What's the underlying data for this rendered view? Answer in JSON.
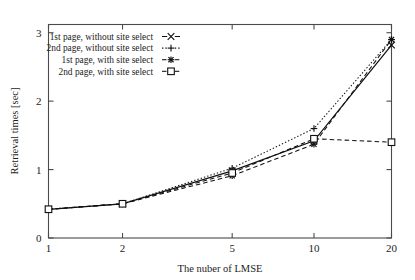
{
  "chart_data": {
    "type": "line",
    "title": "",
    "xlabel": "The nuber of LMSE",
    "ylabel": "Retrieval times [sec]",
    "x": [
      1,
      2,
      5,
      10,
      20
    ],
    "xtick_labels": [
      "1",
      "2",
      "5",
      "10",
      "20"
    ],
    "ytick_labels": [
      "0",
      "1",
      "2",
      "3"
    ],
    "ytick_values": [
      0,
      1,
      2,
      3
    ],
    "ylim": [
      0,
      3.12
    ],
    "xscale": "categorical-log",
    "grid": false,
    "legend_position": "top-left inside plot area",
    "series": [
      {
        "name": "1st page, without site select",
        "marker": "x-cross",
        "linestyle": "solid",
        "values": [
          0.42,
          0.5,
          0.98,
          1.42,
          2.82
        ]
      },
      {
        "name": "2nd page, without site select",
        "marker": "plus",
        "linestyle": "dotted",
        "values": [
          0.42,
          0.5,
          1.02,
          1.6,
          2.9
        ]
      },
      {
        "name": "1st page, with site select",
        "marker": "asterisk",
        "linestyle": "dashed",
        "values": [
          0.42,
          0.5,
          0.91,
          1.37,
          2.9
        ]
      },
      {
        "name": "2nd page, with site select",
        "marker": "open-square",
        "linestyle": "dashed",
        "values": [
          0.42,
          0.5,
          0.95,
          1.45,
          1.4
        ]
      }
    ]
  },
  "legend": {
    "entries": [
      {
        "label": "1st page, without site select"
      },
      {
        "label": "2nd page, without site select"
      },
      {
        "label": "1st page, with site select"
      },
      {
        "label": "2nd page, with site select"
      }
    ]
  },
  "axes": {
    "y_title": "Retrieval times [sec]",
    "x_title": "The nuber of LMSE",
    "y_ticks": [
      "0",
      "1",
      "2",
      "3"
    ],
    "x_ticks": [
      "1",
      "2",
      "5",
      "10",
      "20"
    ]
  },
  "colors": {
    "ink": "#101010",
    "axis": "#4a4a4a",
    "background": "#ffffff"
  }
}
